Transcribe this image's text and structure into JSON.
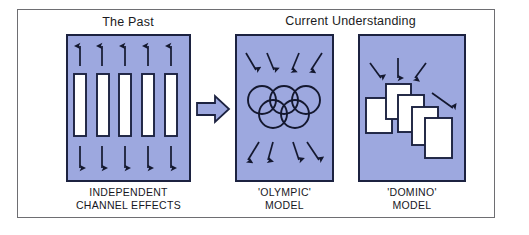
{
  "figure": {
    "title_left": "The Past",
    "title_right": "Current Understanding",
    "border_color": "#6e6e72",
    "panel_fill": "#9da8df",
    "panel_stroke": "#1c2240",
    "element_fill": "#ffffff",
    "text_color": "#17171e"
  },
  "panels": [
    {
      "id": "past",
      "heading": "The Past",
      "caption": "INDEPENDENT\nCHANNEL EFFECTS",
      "diagram": "independent-channels",
      "channel_count": 5,
      "arrows_top": 5,
      "arrows_top_direction": "up",
      "arrows_bottom": 5,
      "arrows_bottom_direction": "down"
    },
    {
      "id": "olympic",
      "heading": "Current Understanding",
      "caption": "'OLYMPIC'\nMODEL",
      "diagram": "olympic-rings",
      "ring_count": 5,
      "rings_top_row": 3,
      "rings_bottom_row": 2,
      "arrows_top": 4,
      "arrows_top_direction": "converging-inward",
      "arrows_bottom": 4,
      "arrows_bottom_direction": "diverging-outward"
    },
    {
      "id": "domino",
      "heading": "Current Understanding",
      "caption": "'DOMINO'\nMODEL",
      "diagram": "falling-dominoes",
      "domino_count": 5,
      "arrows_top": 3,
      "arrows_top_direction": "inward-down",
      "arrows_side": 1,
      "arrows_side_direction": "down-right"
    }
  ],
  "transition": {
    "icon": "block-arrow-right",
    "from_panel": "past",
    "to_panel": "olympic"
  }
}
